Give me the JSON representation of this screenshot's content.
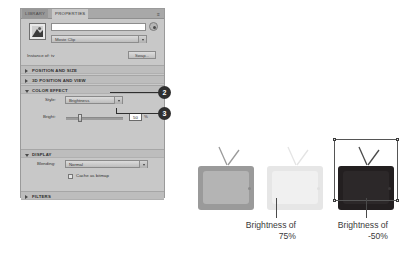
{
  "panel": {
    "tabs": [
      {
        "label": "LIBRARY",
        "active": false
      },
      {
        "label": "PROPERTIES",
        "active": true
      }
    ],
    "menu_glyph": "≡",
    "symbol": {
      "thumb_name": "movie-clip-thumbnail",
      "instance_name_value": "",
      "instance_name_placeholder": "",
      "type_value": "Movie Clip"
    },
    "instance_of": {
      "label": "Instance of: tv",
      "swap_label": "Swap..."
    },
    "sections": [
      {
        "title": "POSITION AND SIZE",
        "open": false
      },
      {
        "title": "3D POSITION AND VIEW",
        "open": false
      },
      {
        "title": "COLOR EFFECT",
        "open": true
      },
      {
        "title": "DISPLAY",
        "open": true
      },
      {
        "title": "FILTERS",
        "open": false
      }
    ],
    "color_effect": {
      "style_label": "Style:",
      "style_value": "Brightness",
      "bright_label": "Bright:",
      "bright_value": "50",
      "bright_unit": "%"
    },
    "display": {
      "blending_label": "Blending:",
      "blending_value": "Normal",
      "cache_label": "Cache as bitmap"
    }
  },
  "callouts": [
    {
      "number": "2",
      "target": "style-dropdown"
    },
    {
      "number": "3",
      "target": "brightness-value-field"
    }
  ],
  "illustration": {
    "tvs": [
      {
        "name": "tv-original",
        "body_color": "#9a9a9a",
        "screen_color": "#b4b4b4",
        "caption": ""
      },
      {
        "name": "tv-bright-75",
        "body_color": "#e8e8e8",
        "screen_color": "#f1f1f1",
        "caption": "Brightness of\n75%"
      },
      {
        "name": "tv-bright-minus-50",
        "body_color": "#231f20",
        "screen_color": "#2d2a2b",
        "caption": "Brightness of\n-50%"
      }
    ],
    "captions": [
      {
        "line1": "Brightness of",
        "line2": "75%"
      },
      {
        "line1": "Brightness of",
        "line2": "-50%"
      }
    ]
  },
  "colors": {
    "panel_bg": "#c8c8c8",
    "section_bg": "#bdbdbd",
    "callout_bg": "#2f2f2f",
    "text": "#333333"
  }
}
